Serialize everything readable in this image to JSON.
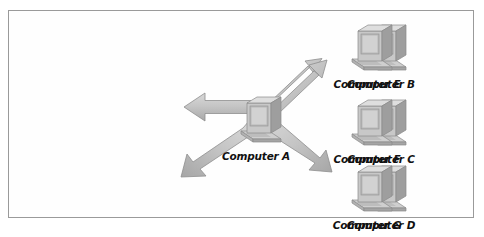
{
  "figure": {
    "kind": "network-topology-diagram",
    "border_color": "#9a9a9a",
    "background_color": "#fefefe",
    "arrow_fill": "#c9c9c9",
    "arrow_edge": "#8c8c8c",
    "label_color": "#111111"
  },
  "nodes": [
    {
      "id": "computer-b",
      "label": "Computer B",
      "icon": "desktop-computer-icon",
      "x": 372,
      "y": 24
    },
    {
      "id": "computer-e",
      "label": "Computer E",
      "icon": "desktop-computer-icon",
      "x": 930,
      "y": 24
    },
    {
      "id": "computer-c",
      "label": "Computer C",
      "icon": "desktop-computer-icon",
      "x": 372,
      "y": 247
    },
    {
      "id": "computer-a",
      "label": "Computer A",
      "icon": "desktop-computer-icon",
      "x": 651,
      "y": 240
    },
    {
      "id": "computer-f",
      "label": "Computer F",
      "icon": "desktop-computer-icon",
      "x": 930,
      "y": 247
    },
    {
      "id": "computer-d",
      "label": "Computer D",
      "icon": "desktop-computer-icon",
      "x": 372,
      "y": 448
    },
    {
      "id": "computer-g",
      "label": "Computer G",
      "icon": "desktop-computer-icon",
      "x": 930,
      "y": 448
    }
  ],
  "arrows": [
    {
      "id": "arrow-a-to-c",
      "from": "computer-a",
      "to": "computer-c",
      "direction": "left",
      "heads": 1
    },
    {
      "id": "arrow-a-to-e",
      "from": "computer-a",
      "to": "computer-e",
      "direction": "upper-right",
      "heads": 1
    },
    {
      "id": "arrow-a-to-d",
      "from": "computer-a",
      "to": "computer-d",
      "direction": "lower-left",
      "heads": 1
    },
    {
      "id": "arrow-a-to-g",
      "from": "computer-a",
      "to": "computer-g",
      "direction": "lower-right",
      "heads": 1
    }
  ]
}
